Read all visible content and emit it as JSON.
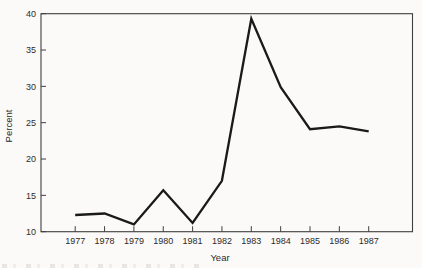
{
  "chart_data": {
    "type": "line",
    "title": "",
    "xlabel": "Year",
    "ylabel": "Percent",
    "categories": [
      "1977",
      "1978",
      "1979",
      "1980",
      "1981",
      "1982",
      "1983",
      "1984",
      "1985",
      "1986",
      "1987"
    ],
    "values": [
      12.3,
      12.5,
      11.0,
      15.7,
      11.2,
      17.0,
      39.3,
      29.9,
      24.1,
      24.5,
      23.8
    ],
    "ylim": [
      10,
      40
    ],
    "yticks": [
      10,
      15,
      20,
      25,
      30,
      35,
      40
    ],
    "grid": false,
    "legend": "none",
    "line_color": "#1a1a1a",
    "axis_color": "#3f3f3f",
    "text_color": "#2b2b2b",
    "background": "#fbfaf8"
  }
}
